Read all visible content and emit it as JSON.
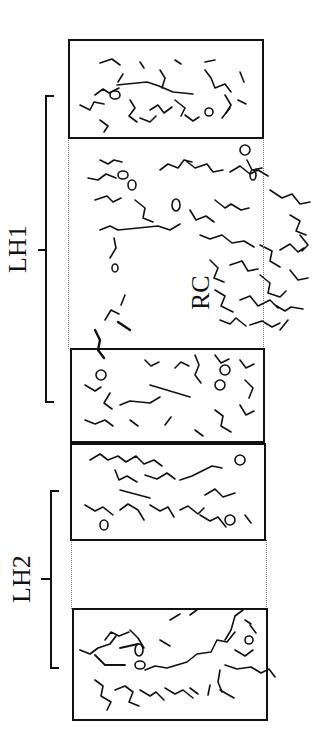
{
  "figure": {
    "labels": {
      "lh1": "LH1",
      "lh2": "LH2",
      "rc": "RC"
    },
    "panels": [
      {
        "id": "panel-1",
        "group": "LH1"
      },
      {
        "id": "panel-2",
        "group": "LH1"
      },
      {
        "id": "panel-3",
        "group": "LH2"
      },
      {
        "id": "panel-4",
        "group": "LH2"
      }
    ],
    "colors": {
      "ink": "#111111",
      "background": "#ffffff",
      "dotted": "#777777"
    }
  }
}
